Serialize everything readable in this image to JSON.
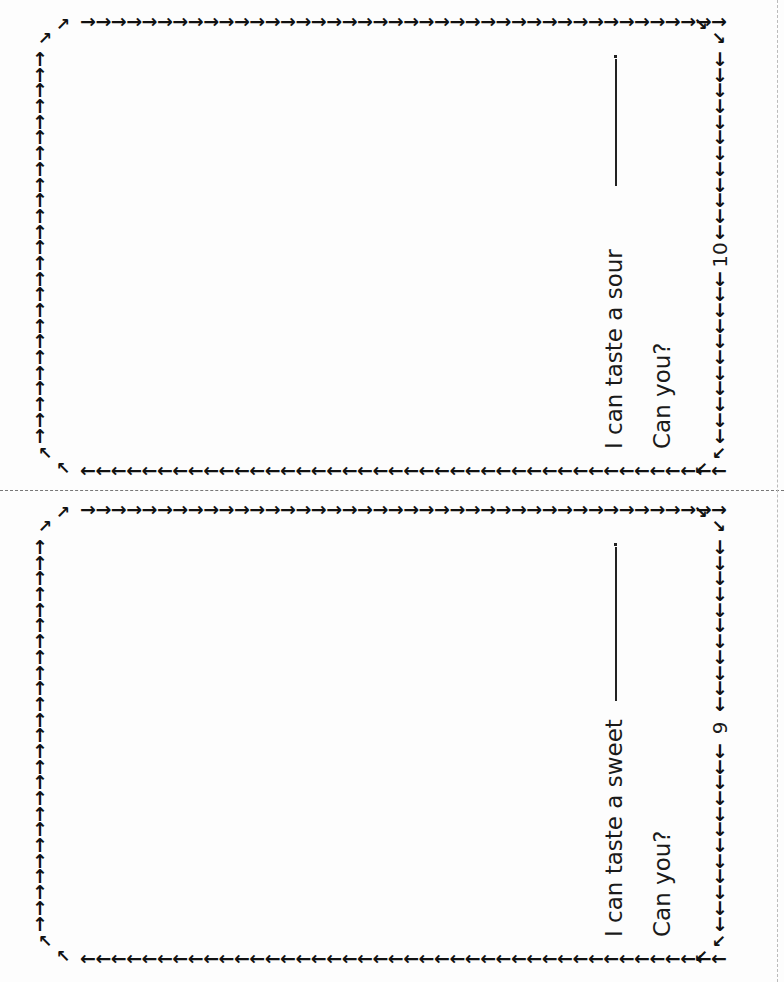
{
  "pages": [
    {
      "id": "page-10",
      "sentence": "I can taste a sour",
      "prompt": "Can you?",
      "page_number": "10",
      "blank_end": "."
    },
    {
      "id": "page-9",
      "sentence": "I can taste a sweet",
      "prompt": "Can you?",
      "page_number": "9",
      "blank_end": "."
    }
  ],
  "border": {
    "top_arrow": "→",
    "bottom_arrow": "←",
    "left_arrow": "↑",
    "right_arrow": "↓",
    "corner_top_left": "↗",
    "corner_top_right": "↘",
    "corner_bottom_right": "↙",
    "corner_bottom_left": "↖"
  },
  "colors": {
    "ink": "#111111",
    "paper": "#fdfdfd"
  }
}
